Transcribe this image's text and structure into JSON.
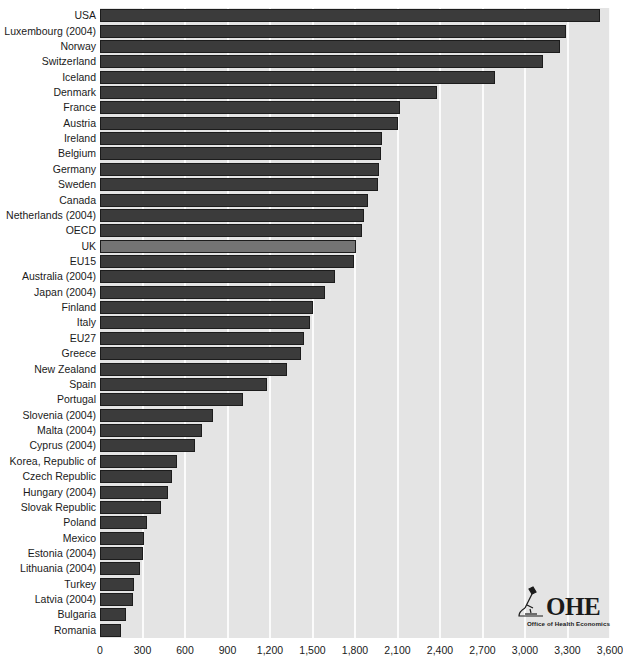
{
  "chart_data": {
    "type": "bar",
    "orientation": "horizontal",
    "title": "",
    "subtitle": "",
    "xlabel": "",
    "ylabel": "",
    "xlim": [
      0,
      3600
    ],
    "xticks": [
      0,
      300,
      600,
      900,
      1200,
      1500,
      1800,
      2100,
      2400,
      2700,
      3000,
      3300,
      3600
    ],
    "xtick_labels": [
      "0",
      "300",
      "600",
      "900",
      "1,200",
      "1,500",
      "1,800",
      "2,100",
      "2,400",
      "2,700",
      "3,000",
      "3,300",
      "3,600"
    ],
    "grid": "vertical",
    "legend": "none",
    "highlight_category": "UK",
    "colors": {
      "bar": "#3b3b3b",
      "bar_highlight": "#747474",
      "bar_border": "#1c1c1c",
      "plot_background": "#e4e4e4",
      "gridline": "#fbfbfb",
      "page_background": "#ffffff",
      "text": "#1a1a1a"
    },
    "categories": [
      "USA",
      "Luxembourg (2004)",
      "Norway",
      "Switzerland",
      "Iceland",
      "Denmark",
      "France",
      "Austria",
      "Ireland",
      "Belgium",
      "Germany",
      "Sweden",
      "Canada",
      "Netherlands (2004)",
      "OECD",
      "UK",
      "EU15",
      "Australia (2004)",
      "Japan (2004)",
      "Finland",
      "Italy",
      "EU27",
      "Greece",
      "New Zealand",
      "Spain",
      "Portugal",
      "Slovenia (2004)",
      "Malta (2004)",
      "Cyprus (2004)",
      "Korea, Republic of",
      "Czech Republic",
      "Hungary (2004)",
      "Slovak Republic",
      "Poland",
      "Mexico",
      "Estonia (2004)",
      "Lithuania (2004)",
      "Turkey",
      "Latvia (2004)",
      "Bulgaria",
      "Romania"
    ],
    "values": [
      3530,
      3290,
      3250,
      3130,
      2790,
      2380,
      2120,
      2100,
      1990,
      1980,
      1970,
      1960,
      1890,
      1860,
      1850,
      1810,
      1790,
      1660,
      1590,
      1500,
      1480,
      1440,
      1420,
      1320,
      1180,
      1010,
      800,
      720,
      670,
      540,
      510,
      480,
      430,
      330,
      310,
      300,
      280,
      240,
      230,
      180,
      150
    ]
  },
  "logo": {
    "mark": "microscope-icon",
    "text": "OHE",
    "subtitle": "Office of Health Economics"
  }
}
